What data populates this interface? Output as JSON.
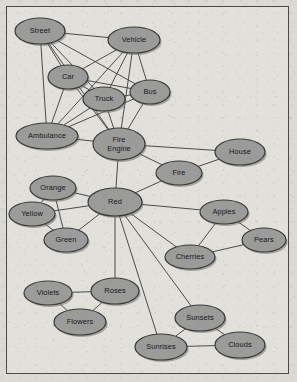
{
  "diagram": {
    "type": "semantic-network",
    "colors": {
      "page_background": "#dcdad4",
      "frame_background": "#e2e0da",
      "frame_border": "#4a4a4a",
      "node_fill": "#9b9b99",
      "node_stroke": "#3a3a3a",
      "node_shadow": "#6f6f6d",
      "edge_stroke": "#4b4b4b",
      "label_color": "#16161a"
    },
    "nodes": [
      {
        "id": "street",
        "label": "Street",
        "x": 40,
        "y": 31,
        "rx": 25,
        "ry": 13
      },
      {
        "id": "vehicle",
        "label": "Vehicle",
        "x": 134,
        "y": 40,
        "rx": 26,
        "ry": 13
      },
      {
        "id": "car",
        "label": "Car",
        "x": 68,
        "y": 77,
        "rx": 20,
        "ry": 12
      },
      {
        "id": "bus",
        "label": "Bus",
        "x": 150,
        "y": 92,
        "rx": 20,
        "ry": 12
      },
      {
        "id": "truck",
        "label": "Truck",
        "x": 104,
        "y": 99,
        "rx": 21,
        "ry": 12
      },
      {
        "id": "ambulance",
        "label": "Ambulance",
        "x": 47,
        "y": 136,
        "rx": 31,
        "ry": 13
      },
      {
        "id": "fireengine",
        "label": "Fire Engine",
        "x": 119,
        "y": 144,
        "rx": 26,
        "ry": 16,
        "line1": "Fire",
        "line2": "Engine"
      },
      {
        "id": "house",
        "label": "House",
        "x": 240,
        "y": 152,
        "rx": 25,
        "ry": 13
      },
      {
        "id": "fire",
        "label": "Fire",
        "x": 179,
        "y": 173,
        "rx": 23,
        "ry": 12
      },
      {
        "id": "orange",
        "label": "Orange",
        "x": 53,
        "y": 188,
        "rx": 23,
        "ry": 12
      },
      {
        "id": "red",
        "label": "Red",
        "x": 115,
        "y": 202,
        "rx": 27,
        "ry": 14
      },
      {
        "id": "yellow",
        "label": "Yellow",
        "x": 32,
        "y": 214,
        "rx": 23,
        "ry": 12
      },
      {
        "id": "apples",
        "label": "Apples",
        "x": 224,
        "y": 212,
        "rx": 24,
        "ry": 12
      },
      {
        "id": "green",
        "label": "Green",
        "x": 66,
        "y": 240,
        "rx": 22,
        "ry": 12
      },
      {
        "id": "pears",
        "label": "Pears",
        "x": 264,
        "y": 240,
        "rx": 22,
        "ry": 12
      },
      {
        "id": "cherries",
        "label": "Cherries",
        "x": 190,
        "y": 257,
        "rx": 25,
        "ry": 12
      },
      {
        "id": "violets",
        "label": "Violets",
        "x": 48,
        "y": 293,
        "rx": 24,
        "ry": 12
      },
      {
        "id": "roses",
        "label": "Roses",
        "x": 115,
        "y": 291,
        "rx": 24,
        "ry": 13
      },
      {
        "id": "flowers",
        "label": "Flowers",
        "x": 80,
        "y": 322,
        "rx": 26,
        "ry": 13
      },
      {
        "id": "sunsets",
        "label": "Sunsets",
        "x": 200,
        "y": 318,
        "rx": 25,
        "ry": 13
      },
      {
        "id": "sunrises",
        "label": "Sunrises",
        "x": 161,
        "y": 347,
        "rx": 26,
        "ry": 13
      },
      {
        "id": "clouds",
        "label": "Clouds",
        "x": 240,
        "y": 345,
        "rx": 25,
        "ry": 13
      }
    ],
    "edges": [
      {
        "from": "street",
        "to": "car"
      },
      {
        "from": "street",
        "to": "truck"
      },
      {
        "from": "street",
        "to": "bus"
      },
      {
        "from": "street",
        "to": "vehicle"
      },
      {
        "from": "street",
        "to": "ambulance"
      },
      {
        "from": "street",
        "to": "fireengine"
      },
      {
        "from": "vehicle",
        "to": "car"
      },
      {
        "from": "vehicle",
        "to": "truck"
      },
      {
        "from": "vehicle",
        "to": "bus"
      },
      {
        "from": "vehicle",
        "to": "ambulance"
      },
      {
        "from": "vehicle",
        "to": "fireengine"
      },
      {
        "from": "car",
        "to": "truck"
      },
      {
        "from": "car",
        "to": "bus"
      },
      {
        "from": "car",
        "to": "ambulance"
      },
      {
        "from": "car",
        "to": "fireengine"
      },
      {
        "from": "truck",
        "to": "bus"
      },
      {
        "from": "truck",
        "to": "ambulance"
      },
      {
        "from": "truck",
        "to": "fireengine"
      },
      {
        "from": "bus",
        "to": "ambulance"
      },
      {
        "from": "bus",
        "to": "fireengine"
      },
      {
        "from": "ambulance",
        "to": "fireengine"
      },
      {
        "from": "fireengine",
        "to": "house"
      },
      {
        "from": "fireengine",
        "to": "fire"
      },
      {
        "from": "fireengine",
        "to": "red"
      },
      {
        "from": "house",
        "to": "fire"
      },
      {
        "from": "fire",
        "to": "red"
      },
      {
        "from": "red",
        "to": "orange"
      },
      {
        "from": "red",
        "to": "yellow"
      },
      {
        "from": "red",
        "to": "green"
      },
      {
        "from": "red",
        "to": "apples"
      },
      {
        "from": "red",
        "to": "cherries"
      },
      {
        "from": "red",
        "to": "roses"
      },
      {
        "from": "red",
        "to": "sunsets"
      },
      {
        "from": "red",
        "to": "sunrises"
      },
      {
        "from": "orange",
        "to": "yellow"
      },
      {
        "from": "orange",
        "to": "green"
      },
      {
        "from": "yellow",
        "to": "green"
      },
      {
        "from": "apples",
        "to": "pears"
      },
      {
        "from": "apples",
        "to": "cherries"
      },
      {
        "from": "pears",
        "to": "cherries"
      },
      {
        "from": "violets",
        "to": "roses"
      },
      {
        "from": "violets",
        "to": "flowers"
      },
      {
        "from": "roses",
        "to": "flowers"
      },
      {
        "from": "sunsets",
        "to": "sunrises"
      },
      {
        "from": "sunsets",
        "to": "clouds"
      },
      {
        "from": "sunrises",
        "to": "clouds"
      }
    ]
  }
}
